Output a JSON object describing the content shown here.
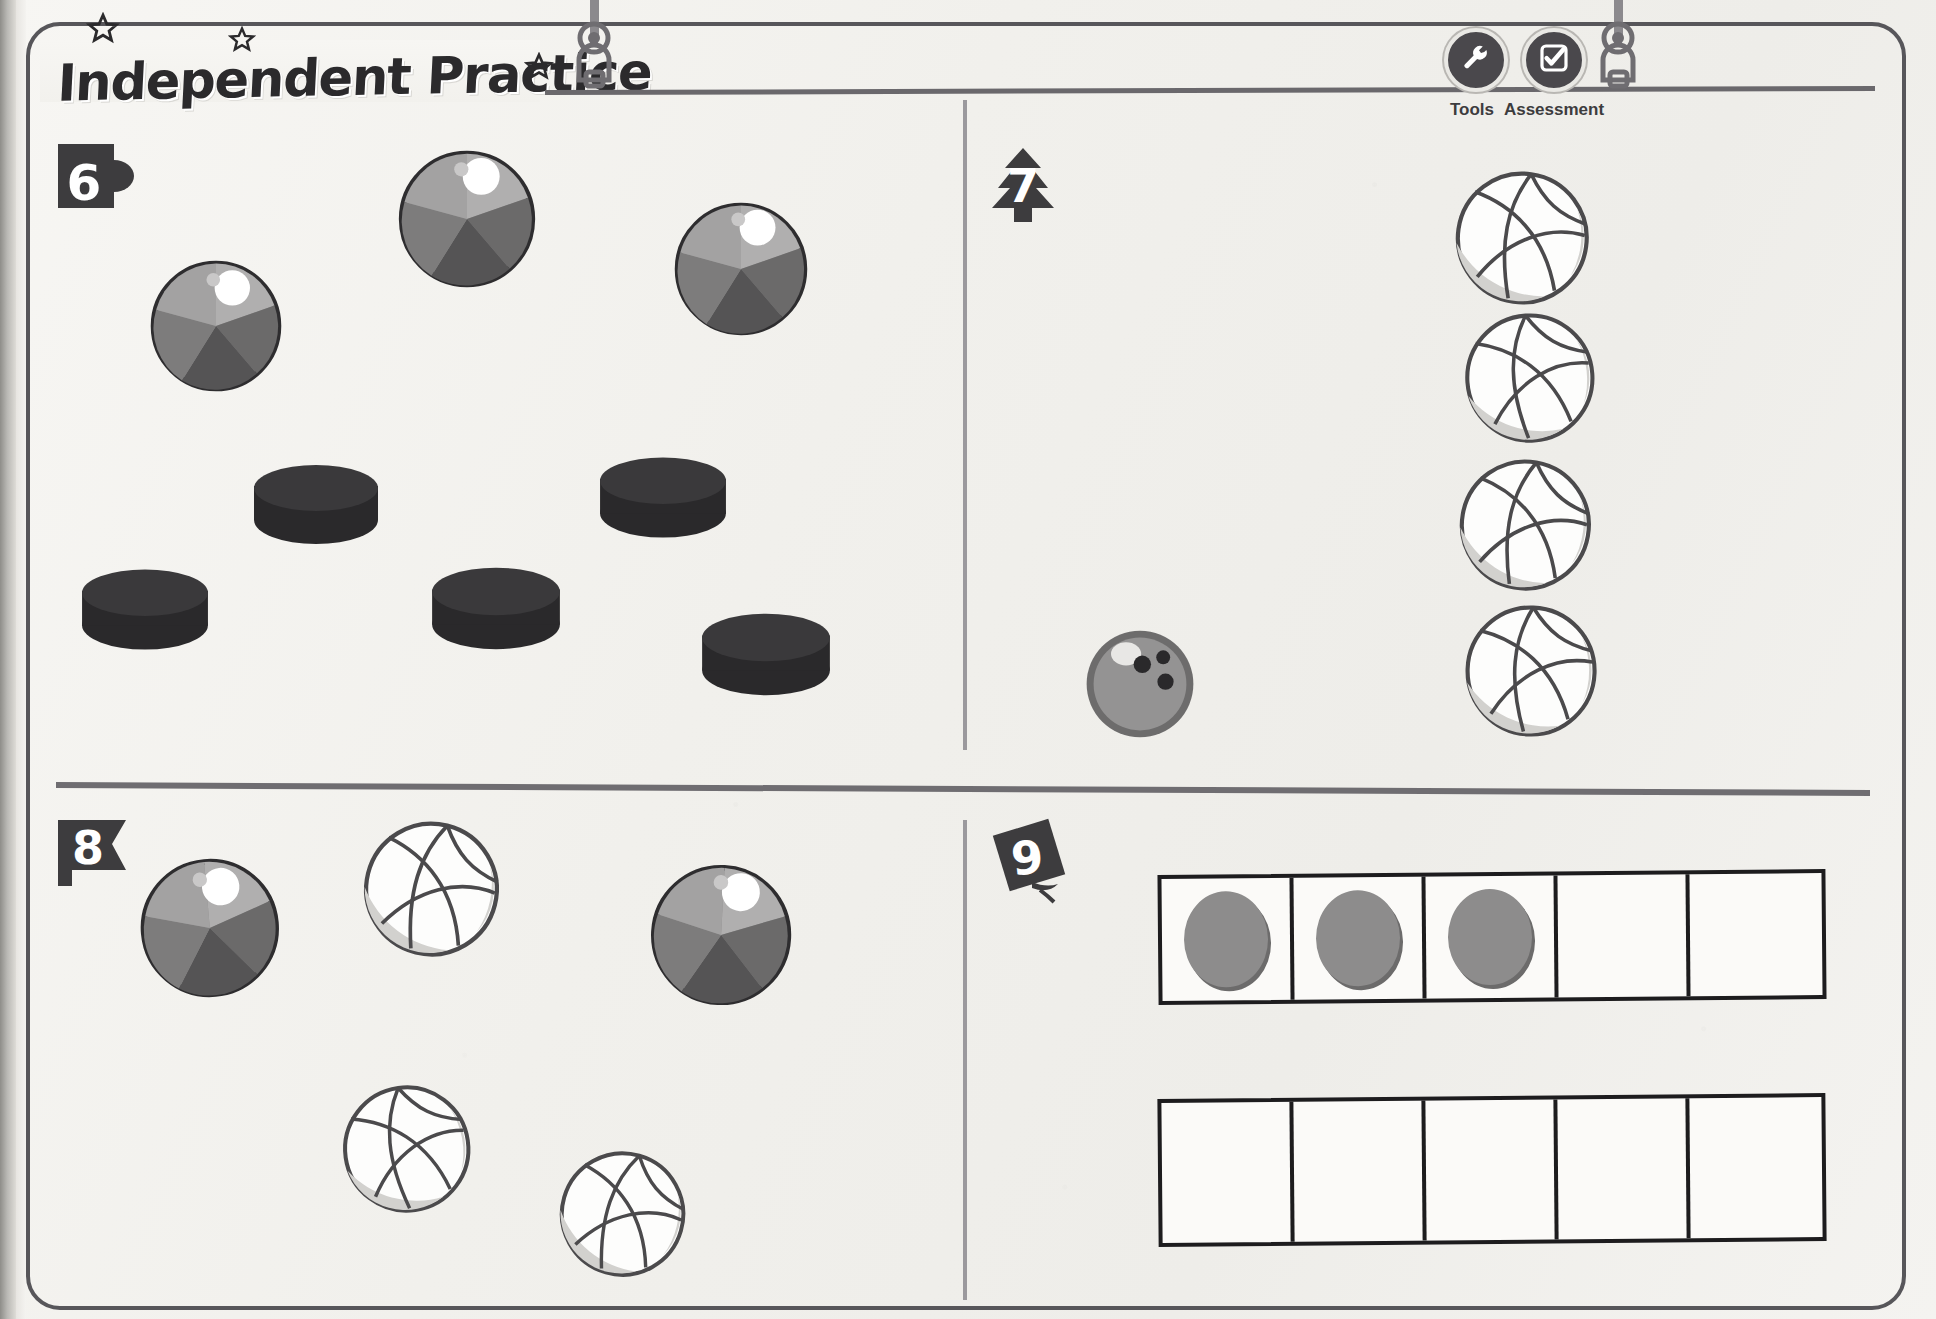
{
  "page": {
    "title": "Independent Practice",
    "background_color": "#f3f2ef",
    "frame_color": "#57565a",
    "ink_color": "#2b2a2c"
  },
  "toolbar": {
    "items": [
      {
        "id": "tools",
        "label": "Tools",
        "icon": "wrench-icon"
      },
      {
        "id": "assessment",
        "label": "Assessment",
        "icon": "checkbox-check-icon"
      }
    ],
    "button_color": "#4a484c"
  },
  "decorations": {
    "stars": [
      {
        "name": "star-1",
        "x": 86,
        "y": 12,
        "size": 34
      },
      {
        "name": "star-2",
        "x": 228,
        "y": 26,
        "size": 28
      },
      {
        "name": "star-3",
        "x": 424,
        "y": 46,
        "size": 28
      }
    ],
    "hanger_clips": [
      {
        "name": "hanger-clip-left",
        "x": 574,
        "y": 0
      },
      {
        "name": "hanger-clip-right",
        "x": 1598,
        "y": 0
      }
    ]
  },
  "problems": [
    {
      "number": "6",
      "badge_shape": "mug",
      "quadrant": "top-left",
      "objects": [
        {
          "type": "beach-ball",
          "x": 148,
          "y": 258,
          "size": 136,
          "rotation": -6
        },
        {
          "type": "beach-ball",
          "x": 396,
          "y": 148,
          "size": 142,
          "rotation": 4
        },
        {
          "type": "beach-ball",
          "x": 672,
          "y": 200,
          "size": 138,
          "rotation": -2
        },
        {
          "type": "hockey-puck",
          "x": 256,
          "y": 468,
          "size": 128
        },
        {
          "type": "hockey-puck",
          "x": 600,
          "y": 460,
          "size": 130
        },
        {
          "type": "hockey-puck",
          "x": 82,
          "y": 570,
          "size": 130
        },
        {
          "type": "hockey-puck",
          "x": 432,
          "y": 568,
          "size": 132
        },
        {
          "type": "hockey-puck",
          "x": 700,
          "y": 612,
          "size": 132
        }
      ],
      "counts": {
        "beach-ball": 3,
        "hockey-puck": 5
      }
    },
    {
      "number": "7",
      "badge_shape": "pine-tree",
      "quadrant": "top-right",
      "objects": [
        {
          "type": "volleyball",
          "x": 1458,
          "y": 172,
          "size": 138,
          "rotation": 8
        },
        {
          "type": "volleyball",
          "x": 1468,
          "y": 312,
          "size": 134,
          "rotation": -4
        },
        {
          "type": "volleyball",
          "x": 1462,
          "y": 460,
          "size": 136,
          "rotation": 10
        },
        {
          "type": "volleyball",
          "x": 1468,
          "y": 606,
          "size": 136,
          "rotation": 2
        },
        {
          "type": "bowling-ball",
          "x": 1086,
          "y": 632,
          "size": 112
        }
      ],
      "counts": {
        "volleyball": 4,
        "bowling-ball": 1
      }
    },
    {
      "number": "8",
      "badge_shape": "flag",
      "quadrant": "bottom-left",
      "objects": [
        {
          "type": "beach-ball",
          "x": 138,
          "y": 856,
          "size": 142,
          "rotation": -5
        },
        {
          "type": "volleyball",
          "x": 360,
          "y": 818,
          "size": 140,
          "rotation": 14
        },
        {
          "type": "beach-ball",
          "x": 648,
          "y": 862,
          "size": 144,
          "rotation": 3
        },
        {
          "type": "volleyball",
          "x": 340,
          "y": 1082,
          "size": 132,
          "rotation": -8
        },
        {
          "type": "volleyball",
          "x": 556,
          "y": 1148,
          "size": 130,
          "rotation": 16
        }
      ],
      "counts": {
        "beach-ball": 2,
        "volleyball": 3
      }
    },
    {
      "number": "9",
      "badge_shape": "diamond-leaf",
      "quadrant": "bottom-right",
      "frames": [
        {
          "name": "five-frame-top",
          "cells": 5,
          "filled": [
            true,
            true,
            true,
            false,
            false
          ],
          "counter_count": 3
        },
        {
          "name": "five-frame-bottom",
          "cells": 5,
          "filled": [
            false,
            false,
            false,
            false,
            false
          ],
          "counter_count": 0
        }
      ]
    }
  ],
  "colors": {
    "beach_ball_outline": "#2e2d2f",
    "beach_ball_light": "#b7b6b6",
    "beach_ball_mid": "#8f8e8e",
    "beach_ball_dark": "#6b6a6a",
    "beach_ball_darker": "#565556",
    "volleyball_fill": "#fdfdfc",
    "volleyball_shade": "#cfcecb",
    "volleyball_line": "#4b4a4c",
    "puck_top": "#3a393b",
    "puck_body": "#2a292b",
    "bowling_fill": "#949393",
    "bowling_edge": "#6d6c6c",
    "counter_fill": "#8d8c8c",
    "frame_line": "#1d1c1e"
  }
}
